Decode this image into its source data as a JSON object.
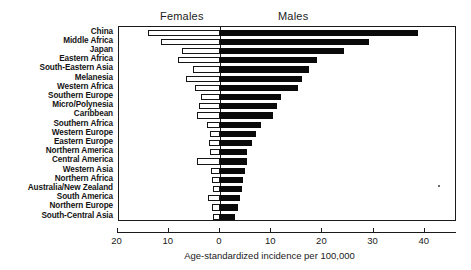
{
  "chart_data": {
    "type": "bar",
    "subtype": "diverging-horizontal-bar",
    "title": "",
    "xlabel": "Age-standardized incidence per 100,000",
    "ylabel": "",
    "grid": false,
    "legend_position": "top-inline-headers",
    "axis": {
      "tick_values": [
        -20,
        -10,
        0,
        10,
        20,
        30,
        40
      ],
      "tick_labels": [
        "20",
        "10",
        "0",
        "10",
        "20",
        "30",
        "40"
      ],
      "xlim": [
        -22,
        44
      ],
      "zero_at": 0
    },
    "headers": {
      "left": "Females",
      "right": "Males"
    },
    "categories": [
      "China",
      "Middle Africa",
      "Japan",
      "Eastern Africa",
      "South-Eastern Asia",
      "Melanesia",
      "Western Africa",
      "Southern Europe",
      "Micro/Polynesia",
      "Caribbean",
      "Southern Africa",
      "Western Europe",
      "Eastern Europe",
      "Northern America",
      "Central America",
      "Western Asia",
      "Northern Africa",
      "Australia/New Zealand",
      "South America",
      "Northern Europe",
      "South-Central Asia"
    ],
    "series": [
      {
        "name": "Females",
        "color": "#ffffff",
        "edge_color": "#151515",
        "direction": "left",
        "values": [
          14.1,
          11.6,
          7.5,
          8.2,
          5.3,
          6.7,
          4.9,
          3.7,
          4.1,
          4.4,
          2.6,
          1.9,
          2.2,
          1.9,
          4.5,
          1.7,
          1.6,
          1.3,
          2.4,
          1.5,
          1.3
        ]
      },
      {
        "name": "Males",
        "color": "#0a0a0a",
        "edge_color": "#0a0a0a",
        "direction": "right",
        "values": [
          38.7,
          29.1,
          24.2,
          19.0,
          17.4,
          16.0,
          15.2,
          11.9,
          11.2,
          10.3,
          8.0,
          7.0,
          6.2,
          5.3,
          5.2,
          4.9,
          4.4,
          4.2,
          4.0,
          3.5,
          2.9
        ]
      }
    ]
  }
}
